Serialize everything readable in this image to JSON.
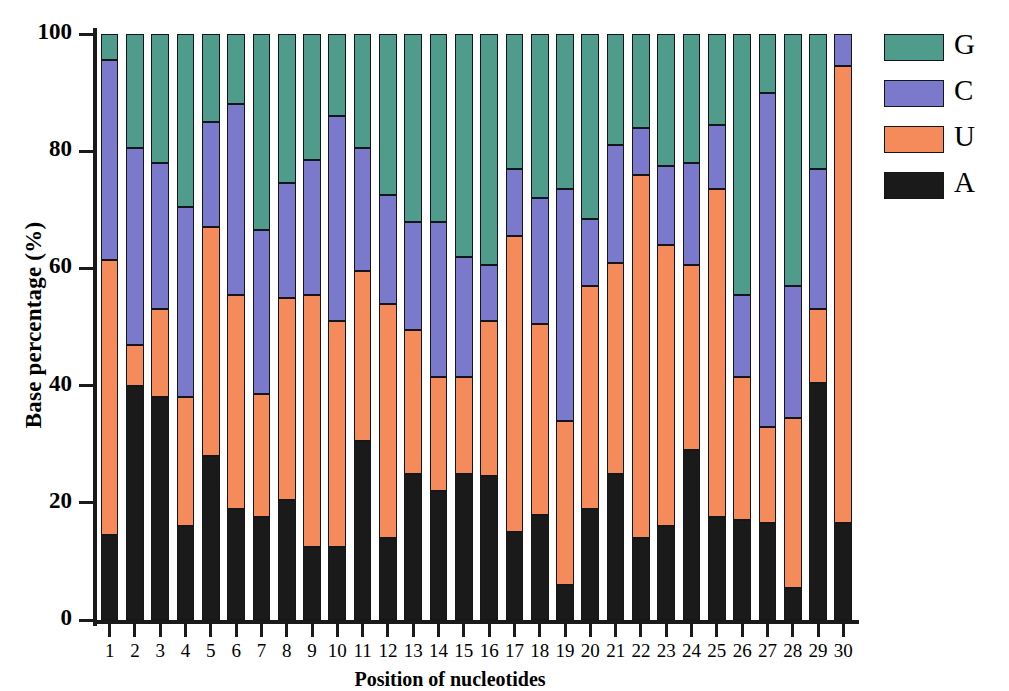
{
  "chart_data": {
    "type": "bar",
    "stacked": true,
    "title": "",
    "xlabel": "Position of nucleotides",
    "ylabel": "Base percentage (%)",
    "ylim": [
      0,
      100
    ],
    "yticks": [
      0,
      20,
      40,
      60,
      80,
      100
    ],
    "grid": false,
    "legend_position": "right",
    "categories": [
      "1",
      "2",
      "3",
      "4",
      "5",
      "6",
      "7",
      "8",
      "9",
      "10",
      "11",
      "12",
      "13",
      "14",
      "15",
      "16",
      "17",
      "18",
      "19",
      "20",
      "21",
      "22",
      "23",
      "24",
      "25",
      "26",
      "27",
      "28",
      "29",
      "30"
    ],
    "series": [
      {
        "name": "A",
        "color": "#1a1a1a",
        "values": [
          14.5,
          40.0,
          38.0,
          16.0,
          28.0,
          19.0,
          17.5,
          20.5,
          12.5,
          12.5,
          30.5,
          14.0,
          25.0,
          22.0,
          25.0,
          24.5,
          15.0,
          18.0,
          6.0,
          19.0,
          25.0,
          14.0,
          16.0,
          29.0,
          17.5,
          17.0,
          16.5,
          5.5,
          40.5,
          16.5
        ]
      },
      {
        "name": "U",
        "color": "#f58a5b",
        "values": [
          47.0,
          7.0,
          15.0,
          22.0,
          39.0,
          36.5,
          21.0,
          34.5,
          43.0,
          38.5,
          29.0,
          40.0,
          24.5,
          19.5,
          16.5,
          26.5,
          50.5,
          32.5,
          28.0,
          38.0,
          36.0,
          62.0,
          48.0,
          31.5,
          56.0,
          24.5,
          16.5,
          29.0,
          12.5,
          78.0
        ]
      },
      {
        "name": "C",
        "color": "#7b79cc",
        "values": [
          34.0,
          33.5,
          25.0,
          32.5,
          18.0,
          32.5,
          28.0,
          19.5,
          23.0,
          35.0,
          21.0,
          18.5,
          18.5,
          26.5,
          20.5,
          9.5,
          11.5,
          21.5,
          39.5,
          11.5,
          20.0,
          8.0,
          13.5,
          17.5,
          11.0,
          14.0,
          57.0,
          22.5,
          24.0,
          5.5
        ]
      },
      {
        "name": "G",
        "color": "#4f9b8c",
        "values": [
          4.5,
          19.5,
          22.0,
          29.5,
          15.0,
          12.0,
          33.5,
          25.5,
          21.5,
          14.0,
          19.5,
          27.5,
          32.0,
          32.0,
          38.0,
          39.5,
          23.0,
          28.0,
          26.5,
          31.5,
          19.0,
          16.0,
          22.5,
          22.0,
          15.5,
          44.5,
          10.0,
          43.0,
          23.0,
          0.0
        ]
      }
    ],
    "cumulative_tops": {
      "A": [
        14.5,
        40.0,
        38.0,
        16.0,
        28.0,
        19.0,
        17.5,
        20.5,
        12.5,
        12.5,
        30.5,
        14.0,
        25.0,
        22.0,
        25.0,
        24.5,
        15.0,
        18.0,
        6.0,
        19.0,
        25.0,
        14.0,
        16.0,
        29.0,
        17.5,
        17.0,
        16.5,
        5.5,
        40.5,
        16.5
      ],
      "AU": [
        61.5,
        47.0,
        53.0,
        38.0,
        67.0,
        55.5,
        38.5,
        55.0,
        55.5,
        51.0,
        59.5,
        54.0,
        49.5,
        41.5,
        41.5,
        51.0,
        65.5,
        50.5,
        34.0,
        57.0,
        61.0,
        76.0,
        64.0,
        60.5,
        73.5,
        41.5,
        33.0,
        34.5,
        53.0,
        94.5
      ],
      "AUC": [
        95.5,
        80.5,
        78.0,
        70.5,
        85.0,
        88.0,
        66.5,
        74.5,
        78.5,
        86.0,
        80.5,
        72.5,
        68.0,
        68.0,
        62.0,
        60.5,
        77.0,
        72.0,
        73.5,
        68.5,
        81.0,
        84.0,
        77.5,
        78.0,
        84.5,
        55.5,
        90.0,
        57.0,
        77.0,
        100.0
      ],
      "AUCG": [
        100,
        100,
        100,
        100,
        100,
        100,
        100,
        100,
        100,
        100,
        100,
        100,
        100,
        100,
        100,
        100,
        100,
        100,
        100,
        100,
        100,
        100,
        100,
        100,
        100,
        100,
        100,
        100,
        100,
        100
      ]
    }
  },
  "legend": {
    "items": [
      {
        "label": "G",
        "color": "#4f9b8c"
      },
      {
        "label": "C",
        "color": "#7b79cc"
      },
      {
        "label": "U",
        "color": "#f58a5b"
      },
      {
        "label": "A",
        "color": "#1a1a1a"
      }
    ]
  },
  "axes": {
    "y_label": "Base percentage (%)",
    "x_label": "Position of nucleotides",
    "y_tick_labels": [
      "100",
      "80",
      "60",
      "40",
      "20",
      "0"
    ],
    "x_tick_labels": [
      "1",
      "2",
      "3",
      "4",
      "5",
      "6",
      "7",
      "8",
      "9",
      "10",
      "11",
      "12",
      "13",
      "14",
      "15",
      "16",
      "17",
      "18",
      "19",
      "20",
      "21",
      "22",
      "23",
      "24",
      "25",
      "26",
      "27",
      "28",
      "29",
      "30"
    ]
  }
}
